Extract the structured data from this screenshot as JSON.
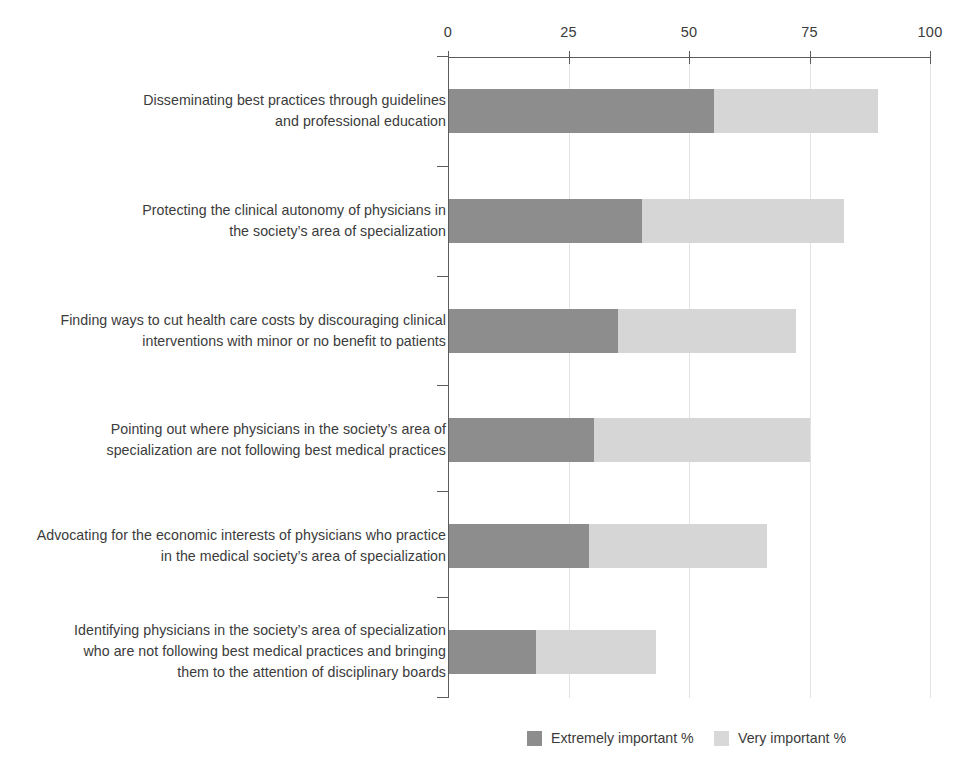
{
  "chart_data": {
    "type": "bar",
    "orientation": "horizontal",
    "stacked": true,
    "title": "",
    "subtitle": "",
    "xlabel": "",
    "ylabel": "",
    "xlim": [
      0,
      100
    ],
    "xticks": [
      0,
      25,
      50,
      75,
      100
    ],
    "xtick_labels": [
      "0",
      "25",
      "50",
      "75",
      "100"
    ],
    "grid": "vertical",
    "legend_position": "bottom-right",
    "categories": [
      "Disseminating best practices through guidelines\nand professional education",
      "Protecting the clinical autonomy of physicians in\nthe society’s area of  specialization",
      "Finding ways to cut health care costs by discouraging clinical\ninterventions with minor or no benefit to patients",
      "Pointing out where physicians in the society’s area of\nspecialization are not following best medical practices",
      "Advocating for the economic interests of physicians who practice\nin the medical society’s area of specialization",
      "Identifying physicians in the society’s area of specialization\nwho are not following best medical practices and bringing\nthem to the attention of disciplinary boards"
    ],
    "series": [
      {
        "name": "Extremely important %",
        "color": "#8d8d8d",
        "values": [
          55,
          40,
          35,
          30,
          29,
          18
        ]
      },
      {
        "name": "Very important %",
        "color": "#d6d6d6",
        "values": [
          34,
          42,
          37,
          45,
          37,
          25
        ]
      }
    ],
    "totals": [
      89,
      82,
      72,
      75,
      66,
      43
    ]
  },
  "axis": {
    "ticks": [
      {
        "label": "0",
        "value": 0
      },
      {
        "label": "25",
        "value": 25
      },
      {
        "label": "50",
        "value": 50
      },
      {
        "label": "75",
        "value": 75
      },
      {
        "label": "100",
        "value": 100
      }
    ]
  },
  "rows": [
    {
      "label": "Disseminating best practices through guidelines\nand professional education",
      "extremely": 55,
      "very": 34,
      "label_top": 90,
      "bar_top": 89
    },
    {
      "label": "Protecting the clinical autonomy of physicians in\nthe society’s area of  specialization",
      "extremely": 40,
      "very": 42,
      "label_top": 200,
      "bar_top": 199
    },
    {
      "label": "Finding ways to cut health care costs by discouraging clinical\ninterventions with minor or no benefit to patients",
      "extremely": 35,
      "very": 37,
      "label_top": 310,
      "bar_top": 309
    },
    {
      "label": "Pointing out where physicians in the society’s area of\nspecialization are not following best medical practices",
      "extremely": 30,
      "very": 45,
      "label_top": 419,
      "bar_top": 418
    },
    {
      "label": "Advocating for the economic interests of physicians who practice\nin the medical society’s area of specialization",
      "extremely": 29,
      "very": 37,
      "label_top": 525,
      "bar_top": 524
    },
    {
      "label": "Identifying physicians in the society’s area of specialization\nwho are not following best medical practices and bringing\nthem to the attention of disciplinary boards",
      "extremely": 18,
      "very": 25,
      "label_top": 620,
      "bar_top": 630
    }
  ],
  "legend": {
    "items": [
      {
        "label": "Extremely important %",
        "swatch": "extremely",
        "left": 527
      },
      {
        "label": "Very important %",
        "swatch": "very",
        "left": 714
      }
    ]
  },
  "colors": {
    "extremely_important": "#8d8d8d",
    "very_important": "#d6d6d6",
    "axis": "#5c5c5c",
    "gridline": "#e3e3e3",
    "text": "#3b3b3b"
  }
}
